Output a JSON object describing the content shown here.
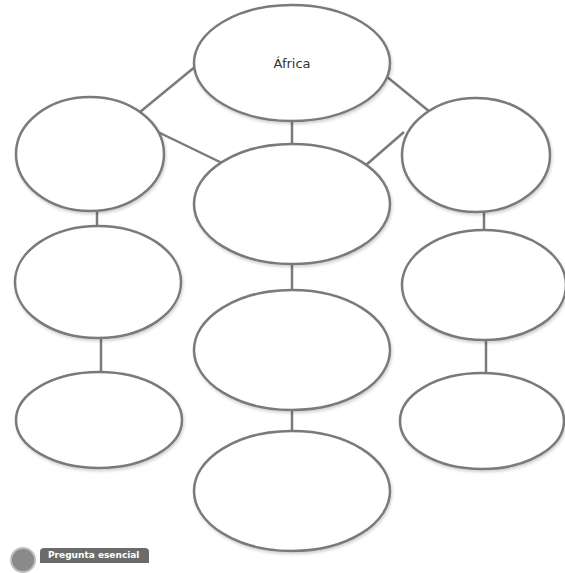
{
  "diagram": {
    "type": "concept-web",
    "stroke_color": "#7a7a7a",
    "center_node": {
      "label": "África"
    },
    "nodes": [
      {
        "id": "top",
        "label": "África",
        "cx": 292,
        "cy": 63,
        "rx": 98,
        "ry": 58
      },
      {
        "id": "left-1",
        "label": "",
        "cx": 90,
        "cy": 154,
        "rx": 74,
        "ry": 57
      },
      {
        "id": "center-1",
        "label": "",
        "cx": 292,
        "cy": 204,
        "rx": 98,
        "ry": 60
      },
      {
        "id": "right-1",
        "label": "",
        "cx": 476,
        "cy": 155,
        "rx": 74,
        "ry": 57
      },
      {
        "id": "left-2",
        "label": "",
        "cx": 98,
        "cy": 282,
        "rx": 83,
        "ry": 56
      },
      {
        "id": "right-2",
        "label": "",
        "cx": 484,
        "cy": 285,
        "rx": 82,
        "ry": 55
      },
      {
        "id": "center-2",
        "label": "",
        "cx": 292,
        "cy": 350,
        "rx": 98,
        "ry": 60
      },
      {
        "id": "left-3",
        "label": "",
        "cx": 99,
        "cy": 420,
        "rx": 83,
        "ry": 48
      },
      {
        "id": "right-3",
        "label": "",
        "cx": 482,
        "cy": 421,
        "rx": 82,
        "ry": 48
      },
      {
        "id": "center-3",
        "label": "",
        "cx": 292,
        "cy": 491,
        "rx": 98,
        "ry": 60
      }
    ],
    "edges": [
      {
        "x1": 196,
        "y1": 66,
        "x2": 140,
        "y2": 112
      },
      {
        "x1": 386,
        "y1": 76,
        "x2": 430,
        "y2": 112
      },
      {
        "x1": 292,
        "y1": 121,
        "x2": 292,
        "y2": 144
      },
      {
        "x1": 158,
        "y1": 132,
        "x2": 222,
        "y2": 163
      },
      {
        "x1": 404,
        "y1": 132,
        "x2": 366,
        "y2": 165
      },
      {
        "x1": 97,
        "y1": 211,
        "x2": 97,
        "y2": 226
      },
      {
        "x1": 484,
        "y1": 212,
        "x2": 484,
        "y2": 230
      },
      {
        "x1": 292,
        "y1": 264,
        "x2": 292,
        "y2": 290
      },
      {
        "x1": 101,
        "y1": 338,
        "x2": 101,
        "y2": 372
      },
      {
        "x1": 486,
        "y1": 340,
        "x2": 486,
        "y2": 373
      },
      {
        "x1": 292,
        "y1": 410,
        "x2": 292,
        "y2": 431
      }
    ]
  },
  "footer": {
    "badge_label": "Pregunta esencial",
    "badge_icon": "question-mark-icon"
  }
}
